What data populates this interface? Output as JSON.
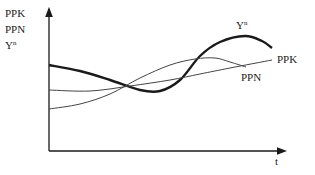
{
  "chart_data": {
    "type": "line",
    "title": "",
    "xlabel": "t",
    "ylabel_lines": [
      "PPK",
      "PPN",
      "Yn"
    ],
    "grid": false,
    "legend": "inline labels at curve ends",
    "series": [
      {
        "name": "Yn",
        "label_base": "Y",
        "label_sup": "n",
        "style": "thick",
        "points": [
          [
            49,
            65
          ],
          [
            80,
            71
          ],
          [
            110,
            80
          ],
          [
            140,
            90
          ],
          [
            160,
            91
          ],
          [
            180,
            80
          ],
          [
            200,
            56
          ],
          [
            220,
            42
          ],
          [
            245,
            36
          ],
          [
            262,
            41
          ],
          [
            272,
            48
          ]
        ]
      },
      {
        "name": "PPK",
        "label_base": "PPK",
        "style": "thin",
        "points": [
          [
            49,
            90
          ],
          [
            90,
            91
          ],
          [
            130,
            86
          ],
          [
            170,
            80
          ],
          [
            200,
            74
          ],
          [
            230,
            68
          ],
          [
            272,
            60
          ]
        ]
      },
      {
        "name": "PPN",
        "label_base": "PPN",
        "style": "thin",
        "points": [
          [
            49,
            109
          ],
          [
            80,
            104
          ],
          [
            110,
            94
          ],
          [
            140,
            78
          ],
          [
            170,
            65
          ],
          [
            195,
            59
          ],
          [
            215,
            58
          ],
          [
            230,
            62
          ],
          [
            246,
            67
          ]
        ]
      }
    ],
    "axes": {
      "origin": [
        49,
        151
      ],
      "y_top": 10,
      "x_right": 284
    }
  },
  "labels": {
    "y_axis_1": "PPK",
    "y_axis_2": "PPN",
    "y_axis_3_base": "Y",
    "y_axis_3_sup": "n",
    "x_axis": "t",
    "curve_yn_base": "Y",
    "curve_yn_sup": "n",
    "curve_ppk": "PPK",
    "curve_ppn": "PPN"
  },
  "colors": {
    "line": "#1a1a1a",
    "thin_line": "#444444",
    "background": "#ffffff"
  }
}
